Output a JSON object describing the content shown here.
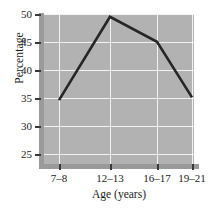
{
  "chart_data": {
    "type": "line",
    "title": "",
    "xlabel": "Age (years)",
    "ylabel": "Percentage",
    "categories": [
      "7–8",
      "12–13",
      "16–17",
      "19–21"
    ],
    "values": [
      34.5,
      49.5,
      45.0,
      35.0
    ],
    "series": [
      {
        "name": "Percentage",
        "values": [
          34.5,
          49.5,
          45.0,
          35.0
        ]
      }
    ],
    "ylim": [
      23,
      50
    ],
    "yticks": [
      25,
      30,
      35,
      40,
      45,
      50
    ],
    "ytick_labels": [
      "25",
      "30",
      "35",
      "40",
      "45",
      "50"
    ],
    "xtick_labels": [
      "7–8",
      "12–13",
      "16–17",
      "19–21"
    ],
    "grid": true,
    "legend": "none",
    "colors": {
      "plot_background": "#b2b2b2",
      "gridline": "#f2f2f2",
      "line": "#262626",
      "axis_spine": "#9a9a9a",
      "text": "#1c1c1c",
      "figure_background": "#ffffff"
    }
  }
}
